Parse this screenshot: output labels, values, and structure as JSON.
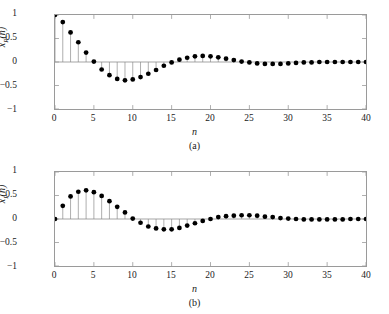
{
  "figure": {
    "background": "#ffffff",
    "axis_color": "#9a9a9a",
    "marker_color": "#000000",
    "stem_color": "#8a8a8a"
  },
  "panels": [
    {
      "id": "panel-a",
      "caption": "(a)",
      "ylabel_base": "x",
      "ylabel_sub": "R",
      "ylabel_arg": "(n)",
      "xlabel": "n",
      "yticks": [
        "1",
        "0.5",
        "0",
        "−0.5",
        "−1"
      ],
      "xticks": [
        "0",
        "5",
        "10",
        "15",
        "20",
        "25",
        "30",
        "35",
        "40"
      ]
    },
    {
      "id": "panel-b",
      "caption": "(b)",
      "ylabel_base": "x",
      "ylabel_sub": "I",
      "ylabel_arg": "(n)",
      "xlabel": "n",
      "yticks": [
        "1",
        "0.5",
        "0",
        "−0.5",
        "−1"
      ],
      "xticks": [
        "0",
        "5",
        "10",
        "15",
        "20",
        "25",
        "30",
        "35",
        "40"
      ]
    }
  ],
  "chart_data": [
    {
      "type": "line",
      "subtype": "stem",
      "panel": "(a)",
      "title": "",
      "xlabel": "n",
      "ylabel": "x_R(n)",
      "xlim": [
        0,
        40
      ],
      "ylim": [
        -1,
        1
      ],
      "yticks": [
        1,
        0.5,
        0,
        -0.5,
        -1
      ],
      "xticks": [
        0,
        5,
        10,
        15,
        20,
        25,
        30,
        35,
        40
      ],
      "grid": false,
      "legend": "none",
      "x": [
        0,
        1,
        2,
        3,
        4,
        5,
        6,
        7,
        8,
        9,
        10,
        11,
        12,
        13,
        14,
        15,
        16,
        17,
        18,
        19,
        20,
        21,
        22,
        23,
        24,
        25,
        26,
        27,
        28,
        29,
        30,
        31,
        32,
        33,
        34,
        35,
        36,
        37,
        38,
        39,
        40
      ],
      "values": [
        1.0,
        0.85,
        0.63,
        0.42,
        0.2,
        0.01,
        -0.16,
        -0.28,
        -0.36,
        -0.39,
        -0.37,
        -0.32,
        -0.25,
        -0.17,
        -0.08,
        -0.01,
        0.05,
        0.09,
        0.12,
        0.13,
        0.12,
        0.1,
        0.07,
        0.04,
        0.01,
        -0.01,
        -0.03,
        -0.04,
        -0.04,
        -0.04,
        -0.03,
        -0.02,
        -0.01,
        -0.01,
        0.0,
        0.0,
        0.0,
        0.0,
        0.0,
        0.0,
        0.0
      ]
    },
    {
      "type": "line",
      "subtype": "stem",
      "panel": "(b)",
      "title": "",
      "xlabel": "n",
      "ylabel": "x_I(n)",
      "xlim": [
        0,
        40
      ],
      "ylim": [
        -1,
        1
      ],
      "yticks": [
        1,
        0.5,
        0,
        -0.5,
        -1
      ],
      "xticks": [
        0,
        5,
        10,
        15,
        20,
        25,
        30,
        35,
        40
      ],
      "grid": false,
      "legend": "none",
      "x": [
        0,
        1,
        2,
        3,
        4,
        5,
        6,
        7,
        8,
        9,
        10,
        11,
        12,
        13,
        14,
        15,
        16,
        17,
        18,
        19,
        20,
        21,
        22,
        23,
        24,
        25,
        26,
        27,
        28,
        29,
        30,
        31,
        32,
        33,
        34,
        35,
        36,
        37,
        38,
        39,
        40
      ],
      "values": [
        0.0,
        0.28,
        0.48,
        0.58,
        0.61,
        0.57,
        0.49,
        0.38,
        0.26,
        0.14,
        0.01,
        -0.08,
        -0.16,
        -0.2,
        -0.22,
        -0.22,
        -0.19,
        -0.14,
        -0.09,
        -0.04,
        0.0,
        0.04,
        0.06,
        0.07,
        0.08,
        0.08,
        0.07,
        0.05,
        0.04,
        0.02,
        0.01,
        0.0,
        -0.01,
        -0.01,
        -0.01,
        -0.01,
        -0.01,
        -0.01,
        0.0,
        0.0,
        0.0
      ]
    }
  ]
}
